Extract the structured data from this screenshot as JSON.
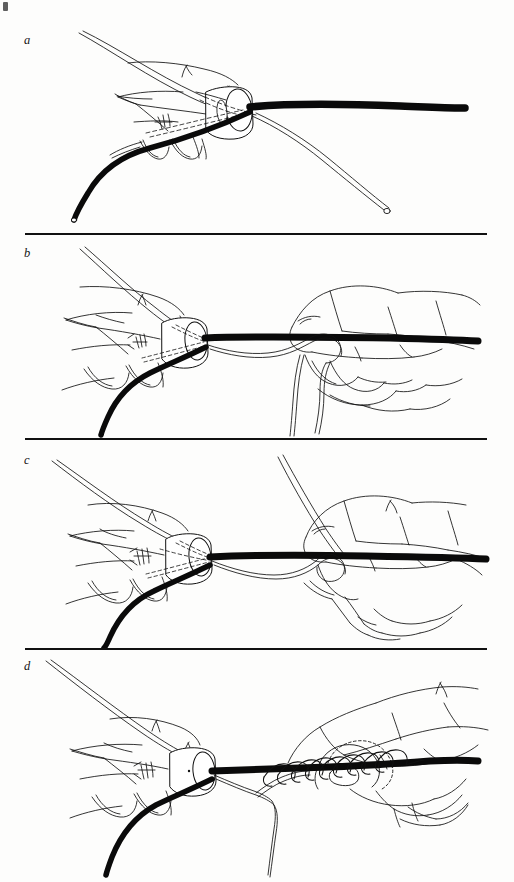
{
  "figure": {
    "background_color": "#fdfdfc",
    "ink_color": "#111111",
    "page_width": 514,
    "page_height": 882,
    "corner_mark": "",
    "style": "pen-and-ink line drawing"
  },
  "panels": [
    {
      "id": "a",
      "label": "a",
      "label_x": 24,
      "label_y": 34,
      "top": 0,
      "height": 233,
      "caption": "Suture strand passed around tube held between thumb and fingers; free end and needle end crossed",
      "elements": {
        "hand": "left hand holding tube between thumb and index finger",
        "tube": "black tube running to the right",
        "suture_dark": "dark suture strand curving down-left",
        "suture_light": "light suture strand curving down-right to tip"
      }
    },
    {
      "id": "b",
      "label": "b",
      "label_x": 24,
      "label_y": 249,
      "top": 233,
      "height": 205,
      "caption": "Right hand brings the free suture end over and under the tube forming the first loop",
      "elements": {
        "hand_left": "left hand stabilizing tube",
        "hand_right": "right hand forming loop",
        "tube": "black tube horizontal across the panel",
        "suture_dark": "dark suture strand curving down-left",
        "suture_light": "light suture strand looping around tube"
      }
    },
    {
      "id": "c",
      "label": "c",
      "label_x": 24,
      "label_y": 457,
      "top": 438,
      "height": 210,
      "caption": "Loop drawn snug against the tube; strand carried over the top for the next wrap",
      "elements": {
        "hand_left": "left hand stabilizing tube",
        "hand_right": "right hand tensioning strand",
        "tube": "black tube horizontal across the panel",
        "suture_dark": "dark suture strand curving down-left",
        "suture_light": "light suture strand ascending to upper right"
      }
    },
    {
      "id": "d",
      "label": "d",
      "label_x": 24,
      "label_y": 664,
      "top": 648,
      "height": 234,
      "caption": "Multiple turns wound tightly along the tube to complete the whipping",
      "elements": {
        "hand_left": "left hand stabilizing tube",
        "hand_right": "right hand winding coils",
        "tube": "black tube horizontal across the panel",
        "suture_dark": "dark suture strand curving down-left",
        "suture_coils": "series of whipped coils around the tube",
        "coil_count": 9
      }
    }
  ],
  "dividers": [
    {
      "y": 233,
      "x": 25,
      "width": 462
    },
    {
      "y": 438,
      "x": 25,
      "width": 462
    },
    {
      "y": 648,
      "x": 25,
      "width": 462
    }
  ]
}
